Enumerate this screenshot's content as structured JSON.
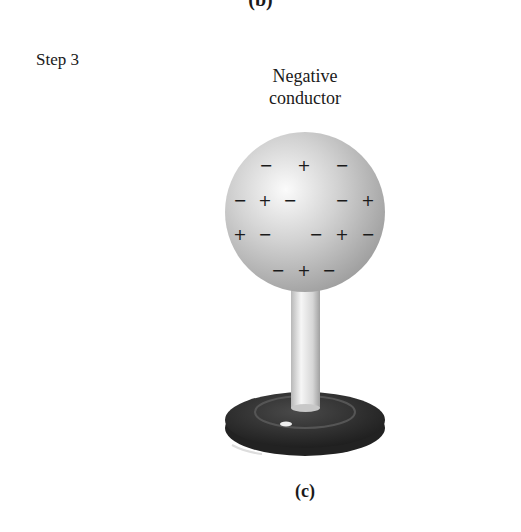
{
  "figure": {
    "previous_label": "(b)",
    "step_label": "Step 3",
    "title_line1": "Negative",
    "title_line2": "conductor",
    "caption": "(c)"
  },
  "sphere": {
    "charges": [
      {
        "sign": "−",
        "x": 266,
        "y": 165
      },
      {
        "sign": "+",
        "x": 304,
        "y": 165
      },
      {
        "sign": "−",
        "x": 342,
        "y": 165
      },
      {
        "sign": "−",
        "x": 240,
        "y": 200
      },
      {
        "sign": "+",
        "x": 265,
        "y": 200
      },
      {
        "sign": "−",
        "x": 290,
        "y": 200
      },
      {
        "sign": "−",
        "x": 342,
        "y": 200
      },
      {
        "sign": "+",
        "x": 368,
        "y": 200
      },
      {
        "sign": "+",
        "x": 240,
        "y": 234
      },
      {
        "sign": "−",
        "x": 265,
        "y": 234
      },
      {
        "sign": "−",
        "x": 316,
        "y": 234
      },
      {
        "sign": "+",
        "x": 342,
        "y": 234
      },
      {
        "sign": "−",
        "x": 368,
        "y": 234
      },
      {
        "sign": "−",
        "x": 278,
        "y": 270
      },
      {
        "sign": "+",
        "x": 304,
        "y": 270
      },
      {
        "sign": "−",
        "x": 329,
        "y": 270
      }
    ]
  },
  "colors": {
    "sphere_light": "#f4f4f4",
    "sphere_dark": "#9a9a9a",
    "base": "#2b2b2b"
  }
}
